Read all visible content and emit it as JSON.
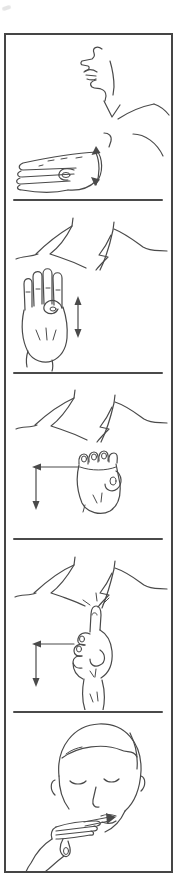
{
  "figure": {
    "type": "sign-language-instruction-strip",
    "panel_count": 5,
    "colors": {
      "background": "#ffffff",
      "line": "#4a4a4a",
      "frame_border": "#454545",
      "divider": "#4a4a4a",
      "scan_smudge": "#d8d8d8"
    },
    "panels": [
      {
        "id": 1,
        "name": "flat-hand-wave-profile",
        "description": "Side profile of a person facing left; a flat hand extends forward palm-down with a curved double-headed arrow at the wrist indicating an up-and-down waving movement.",
        "motion": "up-down-wave"
      },
      {
        "id": 2,
        "name": "open-palm-up-down",
        "description": "Upright open hand, palm facing out with thumb folded across the palm, in front of an open shirt collar; a vertical double-headed arrow indicates up-and-down movement.",
        "motion": "up-down"
      },
      {
        "id": 3,
        "name": "fist-left-then-down",
        "description": "Closed fist with curled fingers facing out in front of an open collar; an arrow path points left and then down.",
        "motion": "left-then-down"
      },
      {
        "id": 4,
        "name": "index-finger-left-then-down",
        "description": "Hand with index finger pointing up touching the collar notch, small motion marks at the fingertip; an arrow path points left and then down.",
        "motion": "left-then-down"
      },
      {
        "id": 5,
        "name": "fingers-to-mouth",
        "description": "Front view of a face with closed eyes; a flat hand is held at the chin with fingertips pointing toward the mouth and an arrow pointing into the mouth.",
        "motion": "toward-mouth"
      }
    ]
  }
}
